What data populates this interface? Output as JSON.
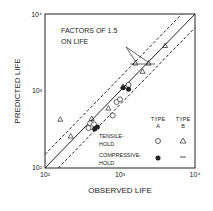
{
  "chart_data": {
    "type": "scatter",
    "title": "",
    "xlabel": "OBSERVED LIFE",
    "ylabel": "PREDICTED LIFE",
    "xscale": "log",
    "yscale": "log",
    "xlim": [
      100,
      10000
    ],
    "ylim": [
      100,
      10000
    ],
    "x_ticks": [
      "10²",
      "10³",
      "10⁴"
    ],
    "y_ticks": [
      "10²",
      "10³",
      "10⁴"
    ],
    "annotation": "FACTORS OF 1.5 ON LIFE",
    "annotation_line1": "FACTORS OF 1.5",
    "annotation_line2": "ON LIFE",
    "legend": {
      "type_a": "TYPE A",
      "type_a_l1": "TYPE",
      "type_a_l2": "A",
      "type_b": "TYPE B",
      "type_b_l1": "TYPE",
      "type_b_l2": "B",
      "tensile": "TENSILE-HOLD",
      "tensile_l1": "TENSILE-",
      "tensile_l2": "HOLD",
      "compressive": "COMPRESSIVE-HOLD",
      "compressive_l1": "COMPRESSIVE-",
      "compressive_l2": "HOLD"
    },
    "series": [
      {
        "name": "Tensile-hold Type A",
        "marker": "open-circle",
        "points": [
          [
            400,
            380
          ],
          [
            420,
            340
          ],
          [
            450,
            370
          ],
          [
            380,
            330
          ],
          [
            800,
            480
          ],
          [
            900,
            720
          ],
          [
            1000,
            780
          ],
          [
            1300,
            1200
          ]
        ]
      },
      {
        "name": "Compressive-hold Type A",
        "marker": "filled-circle",
        "points": [
          [
            460,
            320
          ],
          [
            500,
            340
          ],
          [
            1100,
            1100
          ],
          [
            1300,
            1050
          ]
        ]
      },
      {
        "name": "Tensile-hold Type B",
        "marker": "open-triangle",
        "points": [
          [
            160,
            430
          ],
          [
            220,
            260
          ],
          [
            420,
            440
          ],
          [
            700,
            600
          ],
          [
            1100,
            1150
          ],
          [
            2000,
            1800
          ],
          [
            4000,
            3900
          ],
          [
            1600,
            2300
          ],
          [
            2400,
            2300
          ]
        ]
      }
    ],
    "reference_lines": [
      "y = x (solid)",
      "y = 1.5x (dashed)",
      "y = x/1.5 (dashed)"
    ]
  }
}
